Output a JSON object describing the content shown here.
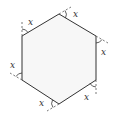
{
  "diagram": {
    "shape": "hexagon",
    "colors": {
      "stroke": "#333333",
      "fill": "#f7f7f7",
      "dashed": "#555555"
    },
    "vertices": [
      {
        "id": "top",
        "x": 59,
        "y": 14
      },
      {
        "id": "upper-right",
        "x": 96,
        "y": 36
      },
      {
        "id": "lower-right",
        "x": 96,
        "y": 80
      },
      {
        "id": "bottom",
        "x": 59,
        "y": 104
      },
      {
        "id": "lower-left",
        "x": 22,
        "y": 80
      },
      {
        "id": "upper-left",
        "x": 22,
        "y": 36
      }
    ],
    "angle_labels": [
      {
        "text": "x",
        "x": 28,
        "y": 25
      },
      {
        "text": "x",
        "x": 73,
        "y": 17
      },
      {
        "text": "x",
        "x": 101,
        "y": 55
      },
      {
        "text": "x",
        "x": 10,
        "y": 68
      },
      {
        "text": "x",
        "x": 39,
        "y": 106
      },
      {
        "text": "x",
        "x": 84,
        "y": 100
      }
    ]
  }
}
